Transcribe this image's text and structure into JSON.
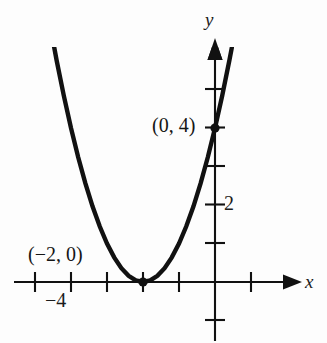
{
  "figure": {
    "kind": "coordinate-graph",
    "background_color": "#fdfdfd",
    "ink_color": "#111111"
  },
  "axes": {
    "x_label": "x",
    "y_label": "y",
    "origin_px": [
      215,
      282
    ],
    "x_unit_px": 36,
    "y_unit_px": 38.5,
    "x_tick_labels": [
      "−4"
    ],
    "y_tick_labels": [
      "2"
    ],
    "x_range": [
      -5.3,
      2.4
    ],
    "y_range": [
      -1.6,
      5.4
    ],
    "grid": false,
    "arrows": [
      "x-positive",
      "y-positive"
    ]
  },
  "annotations": [
    {
      "text": "(0, 4)",
      "point": [
        0,
        4
      ]
    },
    {
      "text": "(−2, 0)",
      "point": [
        -2,
        0
      ]
    }
  ],
  "labels": {
    "y_axis": "y",
    "x_axis": "x",
    "y_tick_2": "2",
    "x_tick_minus4": "−4",
    "point_0_4": "(0, 4)",
    "point_minus2_0": "(−2, 0)"
  },
  "chart_data": {
    "type": "line",
    "title": "",
    "xlabel": "x",
    "ylabel": "y",
    "xlim": [
      -5.3,
      2.4
    ],
    "ylim": [
      -1.6,
      5.4
    ],
    "grid": false,
    "legend": null,
    "xticks": [
      -5,
      -4,
      -3,
      -2,
      -1,
      0,
      1
    ],
    "xticklabels": [
      "",
      "−4",
      "",
      "",
      "",
      "",
      ""
    ],
    "yticks": [
      -1,
      1,
      2,
      3,
      4,
      5
    ],
    "yticklabels": [
      "",
      "",
      "2",
      "",
      "",
      ""
    ],
    "series": [
      {
        "name": "y = (x + 2)^2",
        "equation": "y = (x + 2)^2",
        "x": [
          -4.65,
          -4.4,
          -4.2,
          -4.0,
          -3.8,
          -3.6,
          -3.4,
          -3.2,
          -3.0,
          -2.8,
          -2.6,
          -2.4,
          -2.2,
          -2.0,
          -1.8,
          -1.6,
          -1.4,
          -1.2,
          -1.0,
          -0.8,
          -0.6,
          -0.4,
          -0.2,
          0.0,
          0.2,
          0.4,
          0.47
        ],
        "y": [
          7.02,
          5.76,
          4.84,
          4.0,
          3.24,
          2.56,
          1.96,
          1.44,
          1.0,
          0.64,
          0.36,
          0.16,
          0.04,
          0.0,
          0.04,
          0.16,
          0.36,
          0.64,
          1.0,
          1.44,
          1.96,
          2.56,
          3.24,
          4.0,
          4.84,
          5.76,
          6.1
        ]
      }
    ],
    "points": [
      {
        "label": "(0, 4)",
        "x": 0,
        "y": 4,
        "marked": true
      },
      {
        "label": "(−2, 0)",
        "x": -2,
        "y": 0,
        "marked": true
      }
    ],
    "annotations": [
      {
        "text": "(0, 4)",
        "x": 0,
        "y": 4
      },
      {
        "text": "(−2, 0)",
        "x": -2,
        "y": 0
      }
    ]
  }
}
